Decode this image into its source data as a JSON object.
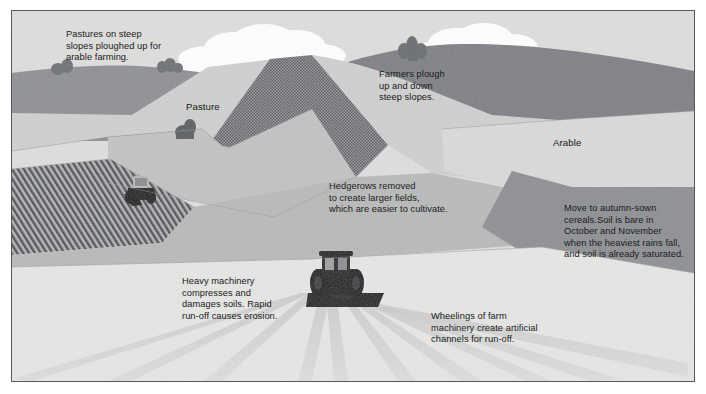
{
  "figure": {
    "kind": "landscape-illustration",
    "palette": {
      "page_background": "#ffffff",
      "frame_border": "#55585c",
      "sky": "#dededd",
      "cloud": "#ffffff",
      "distant_hill_dark": "#8f9195",
      "far_ridge_dark": "#7f8186",
      "pasture_light": "#cfd0cf",
      "pasture_mid": "#c2c3c2",
      "pasture_pale": "#d7d8d7",
      "arable_pale": "#d9dad9",
      "stipple_dark": "#6e7074",
      "hatch_dark": "#6b6d71",
      "foreground_field": "#e6e6e5",
      "mid_field_grey": "#b9baba",
      "right_slope_grey": "#8e9094",
      "tractor_body": "#1d1e20",
      "wheel_track": "#d2d3d2",
      "text": "#1b1b1b"
    }
  },
  "annotations": [
    {
      "id": "pastures",
      "name": "annotation-pastures-ploughed",
      "text": "Pastures on steep\nslopes ploughed up for\narable farming."
    },
    {
      "id": "farmers",
      "name": "annotation-farmers-plough",
      "text": "Farmers plough\nup and down\nsteep slopes."
    },
    {
      "id": "hedgerows",
      "name": "annotation-hedgerows-removed",
      "text": "Hedgerows removed\nto create larger fields,\nwhich are easier to cultivate."
    },
    {
      "id": "autumn",
      "name": "annotation-autumn-sown-cereals",
      "text": "Move to autumn-sown\ncereals.Soil is bare in\nOctober and November\nwhen the heaviest rains fall,\nand soil is already saturated."
    },
    {
      "id": "heavy",
      "name": "annotation-heavy-machinery",
      "text": "Heavy machinery\ncompresses and\ndamages soils. Rapid\nrun-off causes erosion."
    },
    {
      "id": "wheelings",
      "name": "annotation-wheelings-run-off",
      "text": "Wheelings of farm\nmachinery create artificial\nchannels for run-off."
    }
  ],
  "field_labels": [
    {
      "id": "pasture",
      "name": "field-label-pasture",
      "text": "Pasture"
    },
    {
      "id": "arable",
      "name": "field-label-arable",
      "text": "Arable"
    }
  ],
  "scene_objects": [
    {
      "name": "tractor-ploughing-hatched-field",
      "label": "small tractor on dark ploughed field, upper left"
    },
    {
      "name": "tractor-with-implement-foreground",
      "label": "large tractor with trailed implement, foreground"
    },
    {
      "name": "cloud-left",
      "label": "cumulus cloud over central hill"
    },
    {
      "name": "cloud-right",
      "label": "cumulus cloud over right hill"
    },
    {
      "name": "tree-clump-left",
      "label": "trees on distant left ridge"
    },
    {
      "name": "tree-clump-centre",
      "label": "trees on central skyline"
    },
    {
      "name": "hedge-remnant",
      "label": "isolated bush in pasture"
    },
    {
      "name": "wheel-tracks",
      "label": "radiating machinery wheelings in foreground field"
    }
  ]
}
